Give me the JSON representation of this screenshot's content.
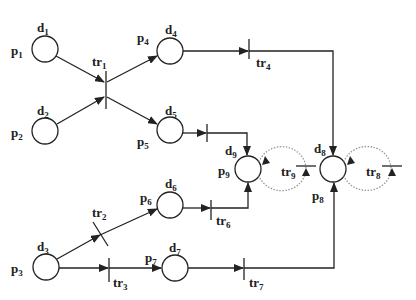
{
  "diagram": {
    "type": "petri-net",
    "places": [
      {
        "id": "p1",
        "label": "p",
        "sub": "1",
        "delay": "d",
        "delay_sub": "1"
      },
      {
        "id": "p2",
        "label": "p",
        "sub": "2",
        "delay": "d",
        "delay_sub": "2"
      },
      {
        "id": "p3",
        "label": "p",
        "sub": "3",
        "delay": "d",
        "delay_sub": "3"
      },
      {
        "id": "p4",
        "label": "p",
        "sub": "4",
        "delay": "d",
        "delay_sub": "4"
      },
      {
        "id": "p5",
        "label": "p",
        "sub": "5",
        "delay": "d",
        "delay_sub": "5"
      },
      {
        "id": "p6",
        "label": "p",
        "sub": "6",
        "delay": "d",
        "delay_sub": "6"
      },
      {
        "id": "p7",
        "label": "p",
        "sub": "7",
        "delay": "d",
        "delay_sub": "7"
      },
      {
        "id": "p8",
        "label": "p",
        "sub": "8",
        "delay": "d",
        "delay_sub": "8"
      },
      {
        "id": "p9",
        "label": "p",
        "sub": "9",
        "delay": "d",
        "delay_sub": "9"
      }
    ],
    "transitions": [
      {
        "id": "tr1",
        "label": "tr",
        "sub": "1"
      },
      {
        "id": "tr2",
        "label": "tr",
        "sub": "2"
      },
      {
        "id": "tr3",
        "label": "tr",
        "sub": "3"
      },
      {
        "id": "tr4",
        "label": "tr",
        "sub": "4"
      },
      {
        "id": "tr6",
        "label": "tr",
        "sub": "6"
      },
      {
        "id": "tr7",
        "label": "tr",
        "sub": "7"
      },
      {
        "id": "tr8",
        "label": "tr",
        "sub": "8"
      },
      {
        "id": "tr9",
        "label": "tr",
        "sub": "9"
      }
    ],
    "arcs": [
      [
        "p1",
        "tr1"
      ],
      [
        "p2",
        "tr1"
      ],
      [
        "tr1",
        "p4"
      ],
      [
        "tr1",
        "p5"
      ],
      [
        "p4",
        "tr4"
      ],
      [
        "tr4",
        "p8"
      ],
      [
        "p5",
        "tr5"
      ],
      [
        "tr5",
        "p9"
      ],
      [
        "p3",
        "tr2"
      ],
      [
        "tr2",
        "p6"
      ],
      [
        "p6",
        "tr6"
      ],
      [
        "tr6",
        "p9"
      ],
      [
        "p3",
        "tr3"
      ],
      [
        "tr3",
        "p7"
      ],
      [
        "p7",
        "tr7"
      ],
      [
        "tr7",
        "p8"
      ],
      [
        "p9",
        "tr9"
      ],
      [
        "tr9",
        "p9"
      ],
      [
        "p8",
        "tr8"
      ],
      [
        "tr8",
        "p8"
      ]
    ],
    "colors": {
      "stroke": "#222222",
      "dotted": "#888888",
      "background": "#ffffff"
    }
  }
}
